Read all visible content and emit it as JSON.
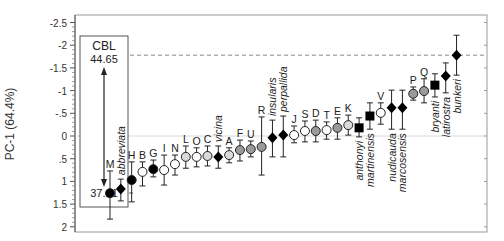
{
  "chart_data": {
    "type": "scatter",
    "title": "",
    "xlabel": "",
    "ylabel": "PC-1 (64.4%)",
    "ylim": [
      -2.5,
      2
    ],
    "y_inverted": true,
    "yticks": [
      "-2.5",
      "-2",
      "-1.5",
      "-1",
      "-.5",
      "0",
      ".5",
      "1",
      "1.5",
      "2"
    ],
    "ytick_values": [
      -2.5,
      -2,
      -1.5,
      -1,
      -0.5,
      0,
      0.5,
      1,
      1.5,
      2
    ],
    "grid": false,
    "reference_line_y": 0,
    "dashed_line_y": -1.78,
    "legend": null,
    "annotation_box": {
      "title": "CBL",
      "top_value": "44.65",
      "bottom_value": "37.21"
    },
    "marker_styles": {
      "black_circle": "#000000",
      "white_circle": "#ffffff",
      "light_gray_circle": "#d9d9d9",
      "gray_circle": "#9a9a9a",
      "black_diamond": "#000000",
      "black_square": "#000000"
    },
    "points": [
      {
        "label": "M",
        "italic": false,
        "marker": "circle",
        "fill": "#000000",
        "value": 1.26,
        "low": 0.77,
        "high": 1.83
      },
      {
        "label": "abbreviata",
        "italic": true,
        "label_pos": "above",
        "marker": "diamond",
        "fill": "#000000",
        "value": 1.17,
        "low": 0.95,
        "high": 1.43
      },
      {
        "label": "H",
        "italic": false,
        "marker": "circle",
        "fill": "#000000",
        "value": 0.97,
        "low": 0.57,
        "high": 1.45
      },
      {
        "label": "B",
        "italic": false,
        "marker": "circle",
        "fill": "#ffffff",
        "value": 0.79,
        "low": 0.57,
        "high": 1.1
      },
      {
        "label": "G",
        "italic": false,
        "marker": "circle",
        "fill": "#000000",
        "value": 0.73,
        "low": 0.53,
        "high": 0.9
      },
      {
        "label": "I",
        "italic": false,
        "marker": "circle",
        "fill": "#ffffff",
        "value": 0.75,
        "low": 0.42,
        "high": 1.08
      },
      {
        "label": "N",
        "italic": false,
        "marker": "circle",
        "fill": "#ffffff",
        "value": 0.62,
        "low": 0.42,
        "high": 0.86
      },
      {
        "label": "L",
        "italic": false,
        "marker": "circle",
        "fill": "#d9d9d9",
        "value": 0.46,
        "low": 0.22,
        "high": 0.71
      },
      {
        "label": "O",
        "italic": false,
        "marker": "circle",
        "fill": "#ffffff",
        "value": 0.46,
        "low": 0.26,
        "high": 0.68
      },
      {
        "label": "C",
        "italic": false,
        "marker": "circle",
        "fill": "#d9d9d9",
        "value": 0.44,
        "low": 0.22,
        "high": 0.66
      },
      {
        "label": "vicina",
        "italic": true,
        "label_pos": "above",
        "marker": "diamond",
        "fill": "#000000",
        "value": 0.46,
        "low": 0.22,
        "high": 0.71
      },
      {
        "label": "A",
        "italic": false,
        "marker": "circle",
        "fill": "#d9d9d9",
        "value": 0.42,
        "low": 0.26,
        "high": 0.59
      },
      {
        "label": "F",
        "italic": false,
        "marker": "circle",
        "fill": "#9a9a9a",
        "value": 0.31,
        "low": 0.09,
        "high": 0.55
      },
      {
        "label": "U",
        "italic": false,
        "marker": "circle",
        "fill": "#9a9a9a",
        "value": 0.29,
        "low": 0.11,
        "high": 0.46
      },
      {
        "label": "R",
        "italic": false,
        "marker": "circle",
        "fill": "#9a9a9a",
        "value": 0.24,
        "low": -0.42,
        "high": 0.86
      },
      {
        "label": "insularis",
        "italic": true,
        "label_pos": "above",
        "marker": "diamond",
        "fill": "#000000",
        "value": 0.04,
        "low": -0.35,
        "high": 0.46
      },
      {
        "label": "perpallida",
        "italic": true,
        "label_pos": "above",
        "marker": "diamond",
        "fill": "#000000",
        "value": -0.02,
        "low": -0.44,
        "high": 0.46
      },
      {
        "label": "J",
        "italic": false,
        "marker": "circle",
        "fill": "#ffffff",
        "value": -0.02,
        "low": -0.22,
        "high": 0.15
      },
      {
        "label": "S",
        "italic": false,
        "marker": "circle",
        "fill": "#ffffff",
        "value": -0.11,
        "low": -0.33,
        "high": 0.13
      },
      {
        "label": "D",
        "italic": false,
        "marker": "circle",
        "fill": "#9a9a9a",
        "value": -0.11,
        "low": -0.35,
        "high": 0.13
      },
      {
        "label": "T",
        "italic": false,
        "marker": "circle",
        "fill": "#ffffff",
        "value": -0.13,
        "low": -0.31,
        "high": 0.07
      },
      {
        "label": "E",
        "italic": false,
        "marker": "circle",
        "fill": "#9a9a9a",
        "value": -0.18,
        "low": -0.4,
        "high": 0.07
      },
      {
        "label": "K",
        "italic": false,
        "marker": "circle",
        "fill": "#d9d9d9",
        "value": -0.24,
        "low": -0.46,
        "high": -0.02
      },
      {
        "label": "anthonyi",
        "italic": true,
        "label_pos": "below",
        "marker": "square",
        "fill": "#000000",
        "value": -0.18,
        "low": -0.4,
        "high": 0.02
      },
      {
        "label": "martinensis",
        "italic": true,
        "label_pos": "below",
        "marker": "square",
        "fill": "#000000",
        "value": -0.44,
        "low": -0.73,
        "high": -0.15
      },
      {
        "label": "V",
        "italic": false,
        "marker": "circle",
        "fill": "#ffffff",
        "value": -0.51,
        "low": -0.73,
        "high": -0.26
      },
      {
        "label": "nudicauda",
        "italic": true,
        "label_pos": "below",
        "marker": "diamond",
        "fill": "#000000",
        "value": -0.62,
        "low": -1.01,
        "high": -0.15
      },
      {
        "label": "marcosensis",
        "italic": true,
        "label_pos": "below",
        "marker": "diamond",
        "fill": "#000000",
        "value": -0.62,
        "low": -1.01,
        "high": -0.15
      },
      {
        "label": "P",
        "italic": false,
        "marker": "circle",
        "fill": "#9a9a9a",
        "value": -0.93,
        "low": -1.08,
        "high": -0.79
      },
      {
        "label": "Q",
        "italic": false,
        "marker": "circle",
        "fill": "#9a9a9a",
        "value": -0.99,
        "low": -1.26,
        "high": -0.73
      },
      {
        "label": "bryanti",
        "italic": true,
        "label_pos": "below",
        "marker": "square",
        "fill": "#000000",
        "value": -1.12,
        "low": -1.37,
        "high": -0.86
      },
      {
        "label": "latirostra",
        "italic": true,
        "label_pos": "below",
        "marker": "diamond",
        "fill": "#000000",
        "value": -1.32,
        "low": -1.61,
        "high": -0.95
      },
      {
        "label": "bunkeri",
        "italic": true,
        "label_pos": "below",
        "marker": "diamond",
        "fill": "#000000",
        "value": -1.78,
        "low": -2.22,
        "high": -1.34
      }
    ]
  }
}
